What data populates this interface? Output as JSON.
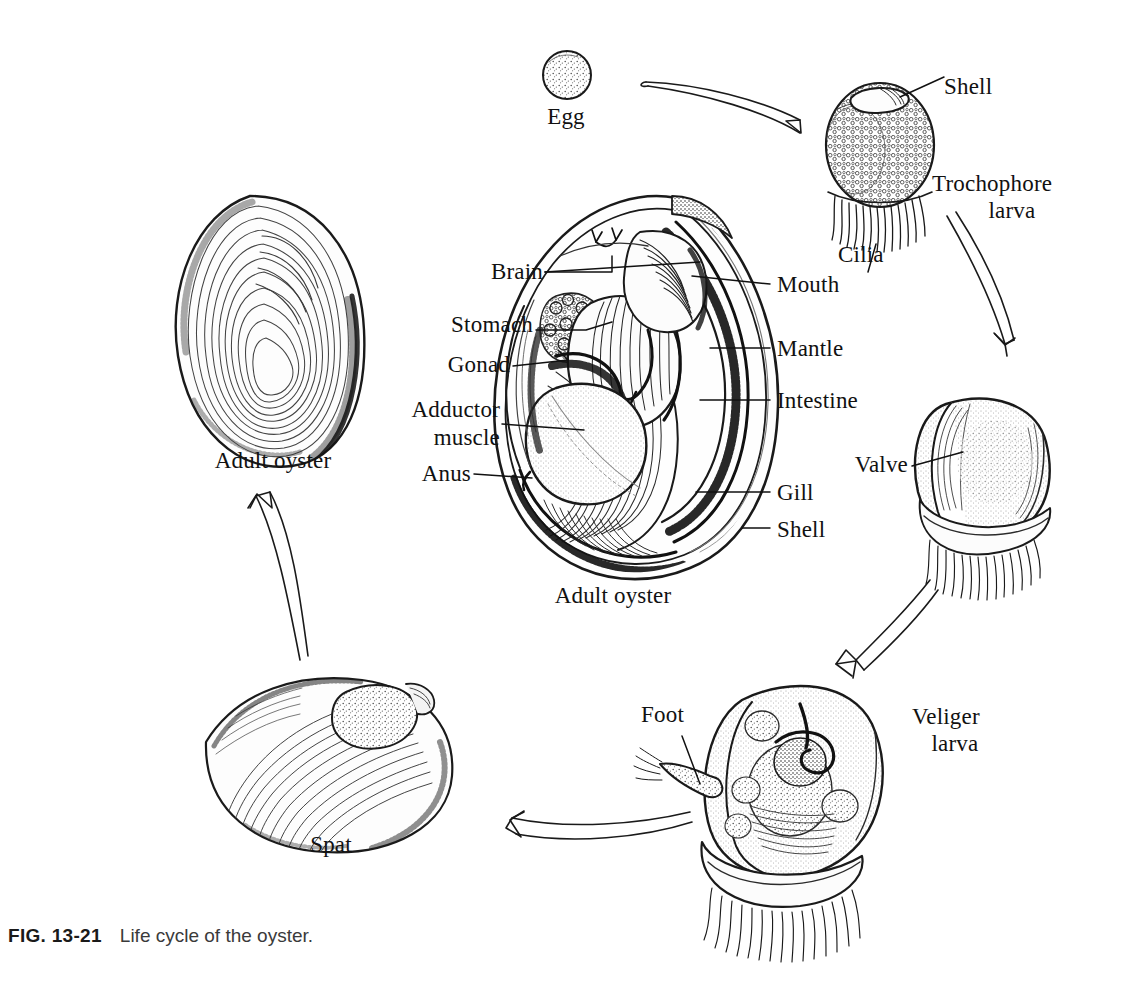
{
  "figure": {
    "number": "FIG. 13-21",
    "caption": "Life cycle of the oyster.",
    "title": "Life cycle of the oyster",
    "background_color": "#ffffff",
    "ink_color": "#111111"
  },
  "stages": [
    {
      "id": "egg",
      "label": "Egg"
    },
    {
      "id": "trochophore",
      "label": "Trochophore\nlarva"
    },
    {
      "id": "veliger",
      "label": "Veliger\nlarva"
    },
    {
      "id": "spat",
      "label": "Spat"
    },
    {
      "id": "adult_oyster_left",
      "label": "Adult oyster"
    },
    {
      "id": "adult_oyster_center",
      "label": "Adult oyster"
    }
  ],
  "part_labels": {
    "trochophore": [
      {
        "id": "shell",
        "label": "Shell"
      },
      {
        "id": "cilia",
        "label": "Cilia"
      }
    ],
    "veliger": [
      {
        "id": "valve",
        "label": "Valve"
      },
      {
        "id": "foot",
        "label": "Foot"
      }
    ],
    "adult_anatomy_left": [
      {
        "id": "brain",
        "label": "Brain"
      },
      {
        "id": "stomach",
        "label": "Stomach"
      },
      {
        "id": "gonad",
        "label": "Gonad"
      },
      {
        "id": "adductor_muscle",
        "label": "Adductor\nmuscle"
      },
      {
        "id": "anus",
        "label": "Anus"
      }
    ],
    "adult_anatomy_right": [
      {
        "id": "mouth",
        "label": "Mouth"
      },
      {
        "id": "mantle",
        "label": "Mantle"
      },
      {
        "id": "intestine",
        "label": "Intestine"
      },
      {
        "id": "gill",
        "label": "Gill"
      },
      {
        "id": "shell",
        "label": "Shell"
      }
    ]
  },
  "cycle_arrows": [
    {
      "id": "egg-to-trochophore",
      "from": "Egg",
      "to": "Trochophore larva"
    },
    {
      "id": "trochophore-to-veliger",
      "from": "Trochophore larva",
      "to": "Veliger larva"
    },
    {
      "id": "veliger-to-settling",
      "from": "Veliger larva",
      "to": "Spat"
    },
    {
      "id": "veliger-to-spat",
      "from": "Veliger larva",
      "to": "Spat"
    },
    {
      "id": "spat-to-adult",
      "from": "Spat",
      "to": "Adult oyster"
    }
  ]
}
